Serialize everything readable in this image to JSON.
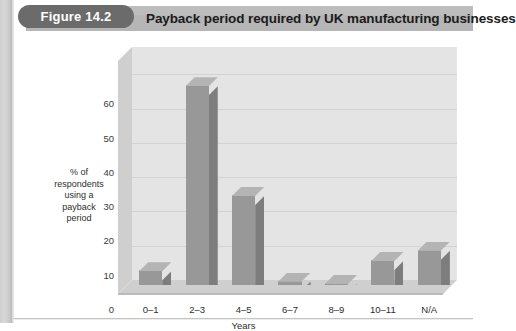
{
  "figure": {
    "badge_label": "Figure 14.2",
    "title": "Payback period required by UK manufacturing businesses"
  },
  "chart_data": {
    "type": "bar",
    "title": "Payback period required by UK manufacturing businesses",
    "categories": [
      "0–1",
      "2–3",
      "4–5",
      "6–7",
      "8–9",
      "10–11",
      "N/A"
    ],
    "values": [
      4,
      58,
      26,
      1,
      0,
      7,
      10
    ],
    "xlabel": "Years",
    "ylabel": "% of respondents using a payback period",
    "ylabel_lines": [
      "% of",
      "respondents",
      "using a",
      "payback",
      "period"
    ],
    "yticks": [
      0,
      10,
      20,
      30,
      40,
      50,
      60
    ],
    "ylim": [
      0,
      68
    ],
    "grid": true,
    "legend": false,
    "style": "3d",
    "colors": {
      "bar_front": "#989898",
      "bar_top": "#b4b4b4",
      "bar_side": "#7d7d7d",
      "plot_background": "#e4e4e4",
      "floor": "#cfcfcf",
      "gridline": "#d2d2d2",
      "header_bar": "#b6b6b6",
      "badge": "#6b6b6b",
      "text": "#2e2e2e"
    }
  }
}
